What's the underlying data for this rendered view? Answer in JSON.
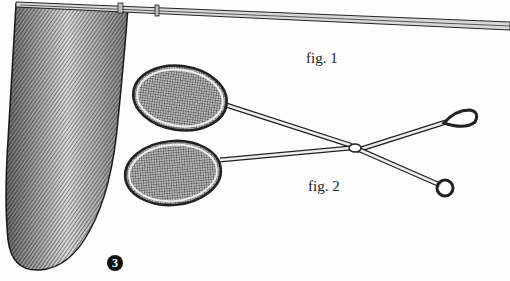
{
  "figures": {
    "fig1_label": "fig. 1",
    "fig2_label": "fig. 2",
    "fig3_badge": "3"
  },
  "colors": {
    "ink": "#1a1a1a",
    "paper": "#fdfdfd"
  }
}
